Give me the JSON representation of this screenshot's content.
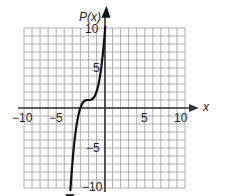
{
  "chart_data": {
    "type": "line",
    "title": "",
    "xlabel": "x",
    "ylabel": "P(x)",
    "xlim": [
      -10,
      10
    ],
    "ylim": [
      -10,
      10
    ],
    "grid": true,
    "grid_step": 1,
    "x_tick_labels": [
      "-10",
      "-5",
      "5",
      "10"
    ],
    "y_tick_labels": [
      "10",
      "5",
      "-5",
      "-10"
    ],
    "x_ticks": [
      -10,
      -5,
      5,
      10
    ],
    "y_ticks": [
      10,
      5,
      -5,
      -10
    ],
    "series": [
      {
        "name": "P(x)",
        "description": "cubic curve with inflection near (-2, 1), arrows at both ends",
        "x": [
          -4.2,
          -4.0,
          -3.5,
          -3.0,
          -2.5,
          -2.0,
          -1.5,
          -1.0,
          -0.5,
          0.0,
          0.1
        ],
        "y": [
          -9.6,
          -7.0,
          -2.4,
          0.0,
          0.9,
          1.0,
          1.1,
          2.0,
          4.4,
          9.0,
          9.9
        ]
      }
    ],
    "legend": null
  },
  "labels": {
    "x_axis": "x",
    "y_axis": "P(x)",
    "x_neg10": "−10",
    "x_neg5": "−5",
    "x_pos5": "5",
    "x_pos10": "10",
    "y_pos10": "10",
    "y_pos5": "5",
    "y_neg5": "−5",
    "y_neg10": "−10"
  },
  "colors": {
    "grid": "#9a9a9a",
    "axis": "#333333",
    "curve": "#111111"
  }
}
